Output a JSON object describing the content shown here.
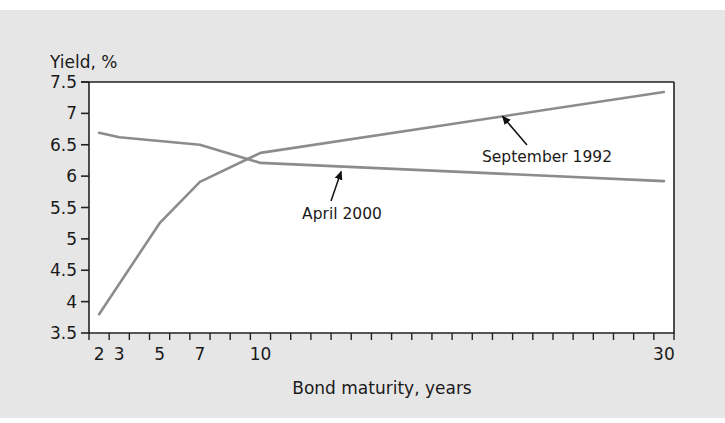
{
  "chart_data": {
    "type": "line",
    "title": "",
    "ylabel": "Yield, %",
    "xlabel": "Bond maturity, years",
    "ylim": [
      3.5,
      7.5
    ],
    "yticks": [
      7.5,
      7,
      6.5,
      6,
      5.5,
      5,
      4.5,
      4,
      3.5
    ],
    "ytick_labels": [
      "7.5",
      "7",
      "6.5",
      "6",
      "5.5",
      "5",
      "4.5",
      "4",
      "3.5"
    ],
    "xlim": [
      2,
      30
    ],
    "xtick_labels": [
      {
        "x": 2,
        "label": "2"
      },
      {
        "x": 3,
        "label": "3"
      },
      {
        "x": 5,
        "label": "5"
      },
      {
        "x": 7,
        "label": "7"
      },
      {
        "x": 10,
        "label": "10"
      },
      {
        "x": 30,
        "label": "30"
      }
    ],
    "grid": false,
    "legend": "none",
    "series": [
      {
        "name": "September 1992",
        "x": [
          2,
          5,
          7,
          10,
          30
        ],
        "values": [
          3.8,
          5.25,
          5.91,
          6.37,
          7.34
        ],
        "color": "#8c8c8c"
      },
      {
        "name": "April 2000",
        "x": [
          2,
          3,
          7,
          10,
          30
        ],
        "values": [
          6.69,
          6.62,
          6.5,
          6.21,
          5.92
        ],
        "color": "#8c8c8c"
      }
    ],
    "annotations": [
      {
        "text": "September 1992",
        "points_to": {
          "x": 22,
          "y": 7.0
        }
      },
      {
        "text": "April 2000",
        "points_to": {
          "x": 14,
          "y": 6.12
        }
      }
    ]
  }
}
